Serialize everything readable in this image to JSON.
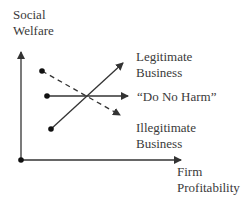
{
  "diagram": {
    "y_axis_label": [
      "Social",
      "Welfare"
    ],
    "x_axis_label": [
      "Firm",
      "Profitability"
    ],
    "lines": [
      {
        "name": "Legitimate Business",
        "label": [
          "Legitimate",
          "Business"
        ],
        "style": "solid",
        "direction": "up"
      },
      {
        "name": "Do No Harm",
        "label": [
          "“Do No Harm”"
        ],
        "style": "solid",
        "direction": "flat"
      },
      {
        "name": "Illegitimate Business",
        "label": [
          "Illegitimate",
          "Business"
        ],
        "style": "dashed",
        "direction": "down"
      }
    ],
    "colors": {
      "line": "#333333",
      "text": "#3a3a3a",
      "background": "#ffffff"
    }
  }
}
